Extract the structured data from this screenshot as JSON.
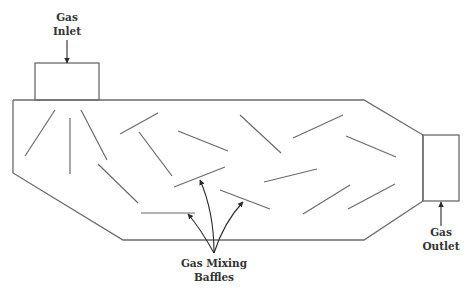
{
  "diagram": {
    "colors": {
      "stroke": "#6b6b6b",
      "text": "#333333",
      "arrow": "#2a2a2a",
      "background": "#ffffff"
    },
    "labels": {
      "inlet": {
        "line1": "Gas",
        "line2": "Inlet",
        "x": 67,
        "y": 10
      },
      "outlet": {
        "line1": "Gas",
        "line2": "Outlet",
        "x": 441,
        "y": 225
      },
      "baffles": {
        "line1": "Gas Mixing",
        "line2": "Baffles",
        "x": 214,
        "y": 256
      }
    },
    "chamber_outline": [
      [
        13,
        100
      ],
      [
        364,
        100
      ],
      [
        423,
        135
      ],
      [
        423,
        201
      ],
      [
        364,
        240
      ],
      [
        123,
        240
      ],
      [
        13,
        173
      ],
      [
        13,
        100
      ]
    ],
    "inlet_box": {
      "x": 35,
      "y": 63,
      "width": 64,
      "height": 37
    },
    "outlet_box": {
      "x": 423,
      "y": 135,
      "width": 36,
      "height": 66
    },
    "inlet_arrow": {
      "x1": 67,
      "y1": 40,
      "x2": 67,
      "y2": 63
    },
    "outlet_arrow": {
      "x1": 441,
      "y1": 226,
      "x2": 441,
      "y2": 202
    },
    "baffles": [
      [
        55,
        110,
        25,
        156
      ],
      [
        70,
        118,
        70,
        174
      ],
      [
        81,
        110,
        107,
        160
      ],
      [
        98,
        164,
        138,
        203
      ],
      [
        120,
        134,
        158,
        113
      ],
      [
        139,
        132,
        172,
        176
      ],
      [
        178,
        131,
        228,
        151
      ],
      [
        174,
        187,
        225,
        167
      ],
      [
        240,
        115,
        281,
        153
      ],
      [
        220,
        190,
        270,
        209
      ],
      [
        293,
        138,
        343,
        115
      ],
      [
        346,
        136,
        396,
        157
      ],
      [
        264,
        182,
        317,
        169
      ],
      [
        303,
        214,
        350,
        185
      ],
      [
        348,
        209,
        395,
        184
      ],
      [
        141,
        213,
        195,
        213
      ]
    ],
    "pointer_arrows": {
      "origin": [
        214,
        253
      ],
      "targets": [
        {
          "tip": [
            188,
            214
          ],
          "ctrl": [
            200,
            228
          ]
        },
        {
          "tip": [
            200,
            180
          ],
          "ctrl": [
            214,
            212
          ]
        },
        {
          "tip": [
            243,
            202
          ],
          "ctrl": [
            224,
            222
          ]
        }
      ]
    }
  }
}
